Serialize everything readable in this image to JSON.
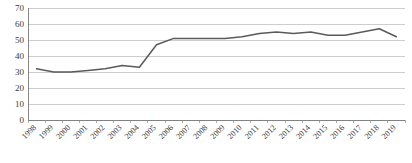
{
  "chart_data": {
    "type": "line",
    "title": "",
    "subtitle": "",
    "xlabel": "",
    "ylabel": "",
    "categories": [
      "1998",
      "1999",
      "2000",
      "2001",
      "2002",
      "2003",
      "2004",
      "2005",
      "2006",
      "2007",
      "2008",
      "2009",
      "2010",
      "2011",
      "2012",
      "2013",
      "2014",
      "2015",
      "2016",
      "2017",
      "2018",
      "2019"
    ],
    "x": [
      1998,
      1999,
      2000,
      2001,
      2002,
      2003,
      2004,
      2005,
      2006,
      2007,
      2008,
      2009,
      2010,
      2011,
      2012,
      2013,
      2014,
      2015,
      2016,
      2017,
      2018,
      2019
    ],
    "values": [
      32,
      30,
      30,
      31,
      32,
      34,
      33,
      47,
      51,
      51,
      51,
      51,
      52,
      54,
      55,
      54,
      55,
      53,
      53,
      55,
      57,
      52
    ],
    "series": [
      {
        "name": "series-1",
        "color": "#5a5a5a",
        "values": [
          32,
          30,
          30,
          31,
          32,
          34,
          33,
          47,
          51,
          51,
          51,
          51,
          52,
          54,
          55,
          54,
          55,
          53,
          53,
          55,
          57,
          52
        ]
      }
    ],
    "ylim": [
      0,
      70
    ],
    "ytick_labels": [
      "0",
      "10",
      "20",
      "30",
      "40",
      "50",
      "60",
      "70"
    ],
    "ytick_values": [
      0,
      10,
      20,
      30,
      40,
      50,
      60,
      70
    ],
    "ystep": 10,
    "grid": true,
    "grid_axis": "y",
    "legend": false,
    "legend_position": "none",
    "markers": false,
    "background_color": "#ffffff",
    "gridline_color": "#b8b8b8",
    "axis_color": "#7a7a7a",
    "label_color": "#3a3a3a",
    "xtick_label_rotation": -45,
    "annotations": []
  },
  "layout": {
    "width": 412,
    "height": 163,
    "plot_left": 28,
    "plot_right": 405,
    "plot_top": 8,
    "plot_bottom": 120
  }
}
